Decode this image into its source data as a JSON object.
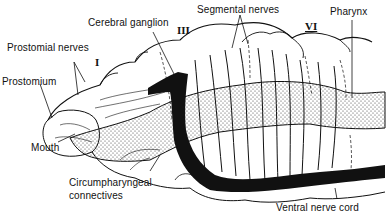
{
  "diagram": {
    "labels": {
      "cerebral_ganglion": "Cerebral ganglion",
      "segmental_nerves": "Segmental nerves",
      "pharynx": "Pharynx",
      "prostomial_nerves": "Prostomial nerves",
      "prostomium": "Prostomium",
      "mouth": "Mouth",
      "circumpharyngeal_1": "Circumpharyngeal",
      "circumpharyngeal_2": "connectives",
      "ventral_nerve_cord": "Ventral nerve cord"
    },
    "segment_numerals": {
      "seg_1": "I",
      "seg_3": "III",
      "seg_6": "VI"
    },
    "colors": {
      "ink": "#111111",
      "background": "#ffffff"
    }
  }
}
